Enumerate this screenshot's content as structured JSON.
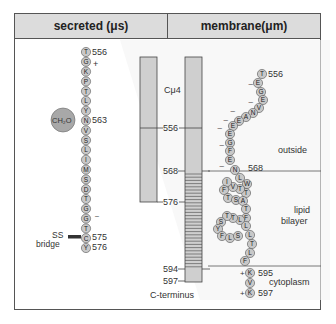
{
  "header": {
    "left_title": "secreted (μs)",
    "right_title": "membrane(μm)"
  },
  "secreted_chain": {
    "residues": [
      "T",
      "G",
      "K",
      "P",
      "T",
      "L",
      "Y",
      "N",
      "V",
      "S",
      "L",
      "I",
      "M",
      "S",
      "D",
      "T",
      "G",
      "G",
      "T",
      "C",
      "Y"
    ],
    "start_label": "556",
    "glyco_label": "563",
    "glyco_group": "CH₂O",
    "ss_label": "575",
    "end_label": "576",
    "plus_sign": "+",
    "minus_sign": "–",
    "ss_bridge_line1": "SS",
    "ss_bridge_line2": "bridge"
  },
  "bars": {
    "domain_label": "Cμ4",
    "ticks": [
      "556",
      "568",
      "576",
      "594",
      "597"
    ],
    "c_terminus": "C-terminus"
  },
  "membrane_chain": {
    "start_label": "556",
    "boundary_label": "568",
    "k595_label": "595",
    "k597_label": "597",
    "regions": [
      "outside",
      "lipid",
      "bilayer",
      "cytoplasm"
    ],
    "residues_outside": [
      "T",
      "E",
      "G",
      "E",
      "V",
      "N",
      "A",
      "E",
      "E",
      "E",
      "G",
      "F",
      "E"
    ],
    "residues_membrane": [
      "N",
      "L",
      "W",
      "T",
      "T",
      "V",
      "I",
      "F",
      "T",
      "S",
      "A",
      "T",
      "F",
      "L",
      "T",
      "T",
      "S",
      "Y",
      "F",
      "L",
      "S",
      "L",
      "L",
      "T",
      "L",
      "F"
    ],
    "residues_cyto": [
      "K",
      "V",
      "K"
    ],
    "plus_sign": "+",
    "minus_sign": "–"
  },
  "colors": {
    "bead_fill": "#c8c8c8",
    "bar_fill": "#cfcfcf",
    "header_fill": "#dcdcdc",
    "line": "#555555"
  }
}
